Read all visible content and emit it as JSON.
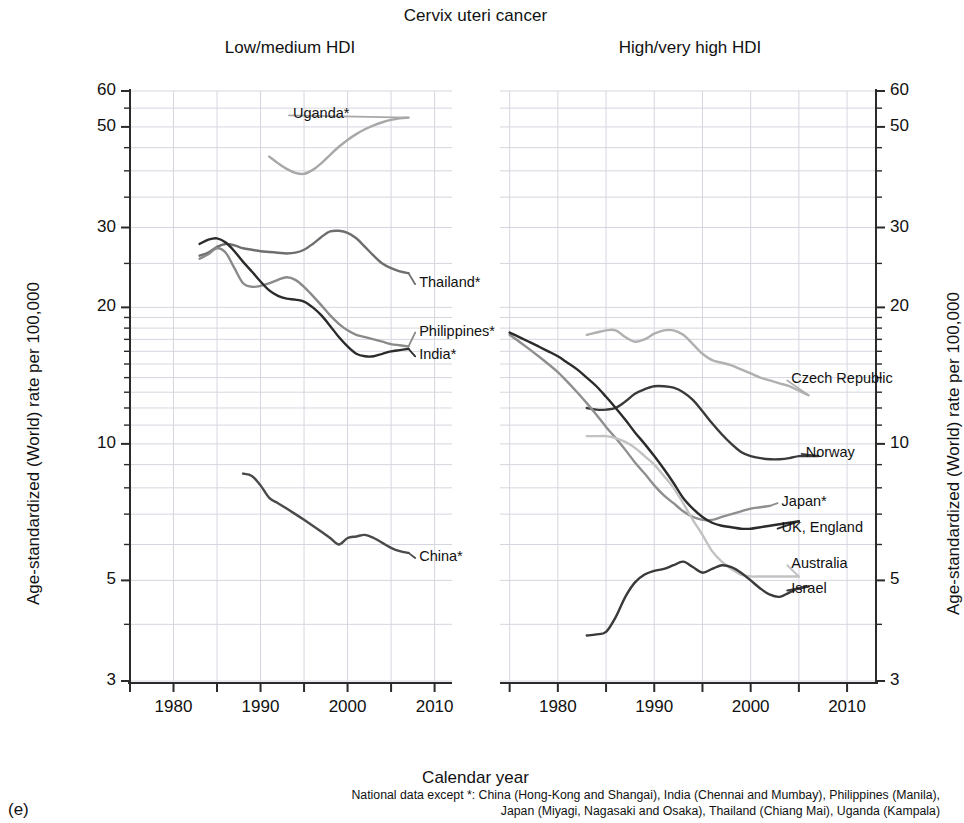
{
  "figure": {
    "title": "Cervix uteri cancer",
    "panel_tag": "(e)",
    "xlabel": "Calendar year",
    "ylabel_left": "Age-standardized (World) rate per 100,000",
    "ylabel_right": "Age-standardized (World) rate per 100,000",
    "footnote_line1": "National data except *: China (Hong-Kong and Shangai), India (Chennai and Mumbay), Philippines (Manila),",
    "footnote_line2": "Japan (Miyagi, Nagasaki and Osaka), Thailand (Chiang Mai), Uganda (Kampala)"
  },
  "panels": {
    "left": {
      "title": "Low/medium HDI"
    },
    "right": {
      "title": "High/very high HDI"
    }
  },
  "axes": {
    "y_ticks": [
      "60",
      "50",
      "30",
      "20",
      "10",
      "5",
      "3"
    ],
    "x_ticks": [
      "1980",
      "1990",
      "2000",
      "2010"
    ],
    "y_scale": "log",
    "y_range": [
      3,
      63
    ],
    "x_range_left": [
      1975,
      2012
    ],
    "x_range_right": [
      1974,
      2013
    ]
  },
  "colors": {
    "dark": "#3a3a3a",
    "mid": "#6e6e6e",
    "light": "#a8a8a8",
    "lighter": "#bdbdbd",
    "grid": "#d6d6e0",
    "axis": "#2b2b2b"
  },
  "chart_data": {
    "type": "line",
    "title": "Cervix uteri cancer",
    "xlabel": "Calendar year",
    "ylabel": "Age-standardized (World) rate per 100,000",
    "yscale": "log",
    "ylim": [
      3,
      63
    ],
    "ytick_values": [
      3,
      5,
      10,
      20,
      30,
      50,
      60
    ],
    "xtick_values": [
      1980,
      1990,
      2000,
      2010
    ],
    "grid": true,
    "legend": "inline end-of-line labels",
    "panels": [
      {
        "name": "Low/medium HDI",
        "xlim": [
          1975,
          2012
        ],
        "series": [
          {
            "name": "Uganda*",
            "color": "#a8a8a8",
            "label_x": 1993.5,
            "label_y": 53,
            "x": [
              1991,
              1992,
              1993,
              1994,
              1995,
              1996,
              1997,
              1998,
              1999,
              2000,
              2001,
              2002,
              2003,
              2004,
              2005,
              2006,
              2007
            ],
            "y": [
              43.0,
              41.6,
              40.4,
              39.6,
              39.4,
              40.2,
              41.6,
              43.4,
              45.2,
              46.8,
              48.2,
              49.4,
              50.4,
              51.2,
              51.8,
              52.2,
              52.4
            ]
          },
          {
            "name": "Thailand*",
            "color": "#6e6e6e",
            "label_x": 2008,
            "label_y": 22.5,
            "x": [
              1983,
              1984,
              1985,
              1986,
              1987,
              1988,
              1989,
              1990,
              1991,
              1992,
              1993,
              1994,
              1995,
              1996,
              1997,
              1998,
              1999,
              2000,
              2001,
              2002,
              2003,
              2004,
              2005,
              2006,
              2007
            ],
            "y": [
              26.0,
              26.4,
              27.2,
              27.6,
              27.4,
              27.0,
              26.8,
              26.6,
              26.5,
              26.4,
              26.3,
              26.4,
              26.8,
              27.6,
              28.6,
              29.4,
              29.5,
              29.2,
              28.4,
              27.2,
              26.0,
              25.0,
              24.4,
              24.0,
              23.8
            ]
          },
          {
            "name": "Philippines*",
            "color": "#8a8a8a",
            "label_x": 2008,
            "label_y": 17.6,
            "x": [
              1983,
              1984,
              1985,
              1986,
              1987,
              1988,
              1989,
              1990,
              1991,
              1992,
              1993,
              1994,
              1995,
              1996,
              1997,
              1998,
              1999,
              2000,
              2001,
              2002,
              2003,
              2004,
              2005,
              2006,
              2007
            ],
            "y": [
              25.6,
              26.2,
              27.0,
              26.4,
              24.4,
              22.6,
              22.2,
              22.3,
              22.6,
              23.0,
              23.3,
              23.0,
              22.2,
              21.2,
              20.2,
              19.2,
              18.4,
              17.8,
              17.4,
              17.2,
              17.0,
              16.8,
              16.6,
              16.5,
              16.4
            ]
          },
          {
            "name": "India*",
            "color": "#2b2b2b",
            "label_x": 2008,
            "label_y": 15.6,
            "x": [
              1983,
              1984,
              1985,
              1986,
              1987,
              1988,
              1989,
              1990,
              1991,
              1992,
              1993,
              1994,
              1995,
              1996,
              1997,
              1998,
              1999,
              2000,
              2001,
              2002,
              2003,
              2004,
              2005,
              2006,
              2007
            ],
            "y": [
              27.6,
              28.2,
              28.4,
              27.8,
              26.6,
              25.2,
              24.0,
              22.8,
              21.8,
              21.2,
              20.9,
              20.8,
              20.6,
              20.0,
              19.2,
              18.2,
              17.2,
              16.4,
              15.8,
              15.6,
              15.6,
              15.8,
              16.0,
              16.1,
              16.2
            ]
          },
          {
            "name": "China*",
            "color": "#4a4a4a",
            "label_x": 2008,
            "label_y": 5.6,
            "x": [
              1988,
              1989,
              1990,
              1991,
              1992,
              1993,
              1994,
              1995,
              1996,
              1997,
              1998,
              1999,
              2000,
              2001,
              2002,
              2003,
              2004,
              2005,
              2006,
              2007
            ],
            "y": [
              8.6,
              8.5,
              8.1,
              7.6,
              7.4,
              7.2,
              7.0,
              6.8,
              6.6,
              6.4,
              6.2,
              6.0,
              6.2,
              6.25,
              6.3,
              6.2,
              6.05,
              5.9,
              5.8,
              5.75
            ]
          }
        ]
      },
      {
        "name": "High/very high HDI",
        "xlim": [
          1974,
          2013
        ],
        "series": [
          {
            "name": "Czech Republic",
            "color": "#b0b0b0",
            "label_x": 2004,
            "label_y": 13.8,
            "x": [
              1983,
              1984,
              1985,
              1986,
              1987,
              1988,
              1989,
              1990,
              1991,
              1992,
              1993,
              1994,
              1995,
              1996,
              1997,
              1998,
              1999,
              2000,
              2001,
              2002,
              2003,
              2004,
              2005,
              2006
            ],
            "y": [
              17.4,
              17.6,
              17.8,
              17.8,
              17.2,
              16.8,
              17.0,
              17.5,
              17.8,
              17.8,
              17.4,
              16.6,
              15.8,
              15.3,
              15.1,
              14.9,
              14.6,
              14.3,
              14.0,
              13.8,
              13.6,
              13.4,
              13.1,
              12.8
            ]
          },
          {
            "name": "Norway",
            "color": "#3a3a3a",
            "label_x": 2005.5,
            "label_y": 9.5,
            "x": [
              1983,
              1984,
              1985,
              1986,
              1987,
              1988,
              1989,
              1990,
              1991,
              1992,
              1993,
              1994,
              1995,
              1996,
              1997,
              1998,
              1999,
              2000,
              2001,
              2002,
              2003,
              2004,
              2005,
              2006,
              2007
            ],
            "y": [
              12.0,
              11.9,
              11.9,
              12.0,
              12.4,
              12.9,
              13.2,
              13.4,
              13.4,
              13.3,
              13.0,
              12.5,
              11.8,
              11.1,
              10.5,
              10.0,
              9.6,
              9.4,
              9.3,
              9.25,
              9.25,
              9.3,
              9.4,
              9.4,
              9.4
            ]
          },
          {
            "name": "Japan*",
            "color": "#8f8f8f",
            "label_x": 2003,
            "label_y": 7.4,
            "x": [
              1975,
              1976,
              1977,
              1978,
              1979,
              1980,
              1981,
              1982,
              1983,
              1984,
              1985,
              1986,
              1987,
              1988,
              1989,
              1990,
              1991,
              1992,
              1993,
              1994,
              1995,
              1996,
              1997,
              1998,
              1999,
              2000,
              2001,
              2002
            ],
            "y": [
              17.4,
              16.8,
              16.2,
              15.6,
              15.0,
              14.4,
              13.7,
              13.0,
              12.3,
              11.6,
              10.9,
              10.3,
              9.7,
              9.1,
              8.6,
              8.1,
              7.7,
              7.4,
              7.1,
              6.9,
              6.8,
              6.8,
              6.9,
              7.0,
              7.1,
              7.2,
              7.25,
              7.3
            ]
          },
          {
            "name": "UK, England",
            "color": "#2b2b2b",
            "label_x": 2003,
            "label_y": 6.5,
            "x": [
              1975,
              1976,
              1977,
              1978,
              1979,
              1980,
              1981,
              1982,
              1983,
              1984,
              1985,
              1986,
              1987,
              1988,
              1989,
              1990,
              1991,
              1992,
              1993,
              1994,
              1995,
              1996,
              1997,
              1998,
              1999,
              2000,
              2001,
              2002,
              2003,
              2004,
              2005
            ],
            "y": [
              17.6,
              17.2,
              16.8,
              16.4,
              16.0,
              15.6,
              15.1,
              14.6,
              14.0,
              13.4,
              12.7,
              12.0,
              11.3,
              10.6,
              10.0,
              9.4,
              8.8,
              8.2,
              7.6,
              7.2,
              6.9,
              6.7,
              6.6,
              6.55,
              6.5,
              6.5,
              6.55,
              6.6,
              6.65,
              6.7,
              6.75
            ]
          },
          {
            "name": "Australia",
            "color": "#c2c2c2",
            "label_x": 2004,
            "label_y": 5.4,
            "x": [
              1983,
              1984,
              1985,
              1986,
              1987,
              1988,
              1989,
              1990,
              1991,
              1992,
              1993,
              1994,
              1995,
              1996,
              1997,
              1998,
              1999,
              2000,
              2001,
              2002,
              2003,
              2004,
              2005
            ],
            "y": [
              10.4,
              10.4,
              10.4,
              10.3,
              10.1,
              9.8,
              9.4,
              9.0,
              8.5,
              8.0,
              7.4,
              6.8,
              6.3,
              5.8,
              5.5,
              5.3,
              5.15,
              5.1,
              5.1,
              5.1,
              5.1,
              5.1,
              5.1
            ]
          },
          {
            "name": "Israel",
            "color": "#3a3a3a",
            "label_x": 2004,
            "label_y": 4.75,
            "x": [
              1983,
              1984,
              1985,
              1986,
              1987,
              1988,
              1989,
              1990,
              1991,
              1992,
              1993,
              1994,
              1995,
              1996,
              1997,
              1998,
              1999,
              2000,
              2001,
              2002,
              2003,
              2004,
              2005,
              2006
            ],
            "y": [
              3.78,
              3.8,
              3.85,
              4.15,
              4.6,
              4.95,
              5.15,
              5.25,
              5.3,
              5.4,
              5.5,
              5.35,
              5.2,
              5.3,
              5.4,
              5.35,
              5.2,
              5.0,
              4.8,
              4.65,
              4.6,
              4.7,
              4.8,
              4.85
            ]
          }
        ]
      }
    ]
  }
}
